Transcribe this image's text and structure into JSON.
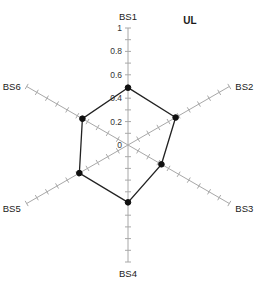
{
  "chart_data": {
    "type": "radar",
    "title": "UL",
    "categories": [
      "BS1",
      "BS2",
      "BS3",
      "BS4",
      "BS5",
      "BS6"
    ],
    "series": [
      {
        "name": "UL",
        "values": [
          0.49,
          0.47,
          0.33,
          0.49,
          0.48,
          0.45
        ]
      }
    ],
    "rlim": [
      0,
      1
    ],
    "tick_values": [
      0,
      0.2,
      0.4,
      0.6,
      0.8,
      1
    ],
    "tick_labels": [
      "0",
      "0.2",
      "0.4",
      "0.6",
      "0.8",
      "1"
    ],
    "minor_tick_step": 0.1,
    "axis_label_position": "outer",
    "tick_label_axis": "BS1",
    "grid": false,
    "legend": "none",
    "xlabel": "",
    "ylabel": "",
    "colors": {
      "series_line": "#222222",
      "series_marker": "#111111",
      "spoke": "#a8a8a8",
      "text": "#1a1a1a",
      "background": "#ffffff"
    }
  },
  "labels": {
    "bs1": "BS1",
    "bs2": "BS2",
    "bs3": "BS3",
    "bs4": "BS4",
    "bs5": "BS5",
    "bs6": "BS6",
    "title": "UL",
    "tick_0": "0",
    "tick_02": "0.2",
    "tick_04": "0.4",
    "tick_06": "0.6",
    "tick_08": "0.8",
    "tick_1": "1"
  }
}
